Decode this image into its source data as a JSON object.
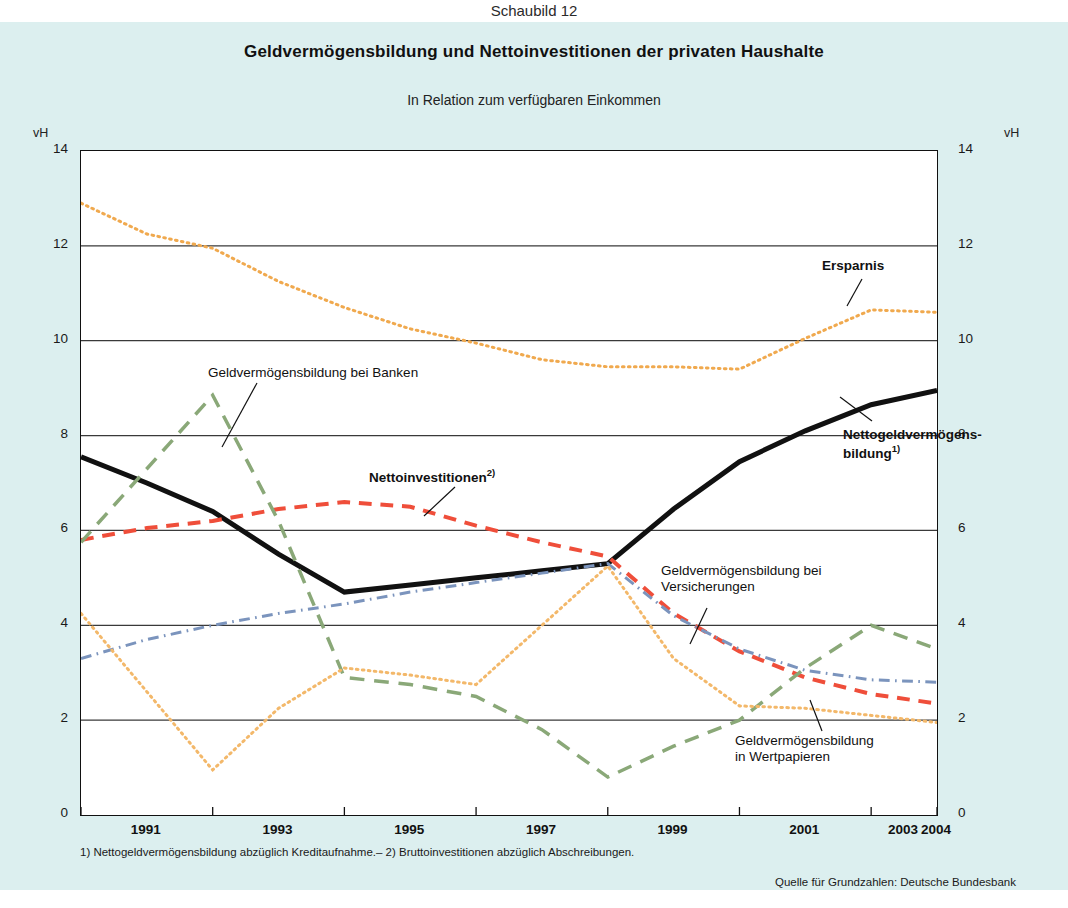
{
  "figure_number": "Schaubild 12",
  "title": "Geldvermögensbildung und Nettoinvestitionen der privaten Haushalte",
  "subtitle": "In Relation zum verfügbaren Einkommen",
  "unit_left": "vH",
  "unit_right": "vH",
  "footnote": "1) Nettogeldvermögensbildung abzüglich Kreditaufnahme.– 2) Bruttoinvestitionen abzüglich Abschreibungen.",
  "source": "Quelle für Grundzahlen: Deutsche Bundesbank",
  "annotations": {
    "banken": "Geldvermögensbildung bei Banken",
    "nettoinvestitionen": "Nettoinvestitionen",
    "nettoinvestitionen_sup": "2)",
    "ersparnis": "Ersparnis",
    "nettogeld_line1": "Nettogeldvermögens-",
    "nettogeld_line2": "bildung",
    "nettogeld_sup": "1)",
    "versicherungen_line1": "Geldvermögensbildung bei",
    "versicherungen_line2": "Versicherungen",
    "wertpapiere_line1": "Geldvermögensbildung",
    "wertpapiere_line2": "in Wertpapieren"
  },
  "colors": {
    "background": "#dcefef",
    "plot_background": "#ffffff",
    "axis": "#111111",
    "grid": "#3a3a3a",
    "nettogeldvermoegensbildung": "#111111",
    "ersparnis": "#f0a94e",
    "banken": "#8aa878",
    "nettoinvestitionen": "#ef4e3a",
    "versicherungen": "#7b94bd",
    "wertpapiere": "#f3b86a"
  },
  "chart_data": {
    "type": "line",
    "title": "Geldvermögensbildung und Nettoinvestitionen der privaten Haushalte",
    "subtitle": "In Relation zum verfügbaren Einkommen",
    "xlabel": "",
    "ylabel": "vH",
    "ylim": [
      0,
      14
    ],
    "yticks": [
      0,
      2,
      4,
      6,
      8,
      10,
      12,
      14
    ],
    "ytick_labels": [
      "0",
      "2",
      "4",
      "6",
      "8",
      "10",
      "12",
      "14"
    ],
    "grid": true,
    "legend": "inline-annotations",
    "dual_axis": true,
    "x": [
      1991,
      1992,
      1993,
      1994,
      1995,
      1996,
      1997,
      1998,
      1999,
      2000,
      2001,
      2002,
      2003,
      2004
    ],
    "xtick_labels": [
      "1991",
      "1993",
      "1995",
      "1997",
      "1999",
      "2001",
      "2003",
      "2004"
    ],
    "xtick_years": [
      1991,
      1993,
      1995,
      1997,
      1999,
      2001,
      2003,
      2004
    ],
    "series": [
      {
        "name": "Ersparnis",
        "style": "dotted",
        "color": "#f0a94e",
        "width": 3,
        "values": [
          12.9,
          12.25,
          11.95,
          11.25,
          10.7,
          10.25,
          9.95,
          9.6,
          9.45,
          9.45,
          9.4,
          10.05,
          10.65,
          10.6
        ]
      },
      {
        "name": "Nettogeldvermögensbildung1)",
        "style": "solid",
        "color": "#111111",
        "width": 5,
        "values": [
          7.55,
          7.0,
          6.4,
          5.5,
          4.7,
          4.85,
          5.0,
          5.15,
          5.3,
          6.45,
          7.45,
          8.1,
          8.65,
          8.95
        ]
      },
      {
        "name": "Nettoinvestitionen2)",
        "style": "dashed",
        "color": "#ef4e3a",
        "width": 4,
        "values": [
          5.8,
          6.05,
          6.2,
          6.45,
          6.6,
          6.5,
          6.1,
          5.75,
          5.45,
          4.25,
          3.45,
          2.9,
          2.55,
          2.35
        ]
      },
      {
        "name": "Geldvermögensbildung bei Banken",
        "style": "dashed-long",
        "color": "#8aa878",
        "width": 3.5,
        "values": [
          5.75,
          7.3,
          8.85,
          6.2,
          2.9,
          2.75,
          2.5,
          1.8,
          0.8,
          1.45,
          2.0,
          3.1,
          4.0,
          3.5
        ]
      },
      {
        "name": "Geldvermögensbildung bei Versicherungen",
        "style": "dashdot",
        "color": "#7b94bd",
        "width": 3,
        "values": [
          3.3,
          3.7,
          4.0,
          4.25,
          4.45,
          4.7,
          4.9,
          5.1,
          5.3,
          4.2,
          3.5,
          3.05,
          2.85,
          2.8
        ]
      },
      {
        "name": "Geldvermögensbildung in Wertpapieren",
        "style": "dotted",
        "color": "#f3b86a",
        "width": 3,
        "values": [
          4.25,
          2.6,
          0.95,
          2.25,
          3.1,
          2.95,
          2.75,
          4.0,
          5.25,
          3.3,
          2.3,
          2.25,
          2.1,
          1.95
        ]
      }
    ]
  }
}
